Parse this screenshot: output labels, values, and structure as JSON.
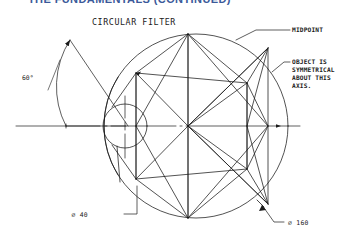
{
  "page": {
    "background_color": "#ffffff",
    "line_color": "#1a1a1a",
    "header_color": "#3b5a9a"
  },
  "header": {
    "clipped_text": "THE FUNDAMENTALS (CONTINUED)",
    "note": "top heading row is cropped off at the top edge"
  },
  "drawing": {
    "title": "CIRCULAR FILTER",
    "annotations": [
      {
        "id": "midpoint",
        "text": "MIDPOINT"
      },
      {
        "id": "symmetry-note",
        "lines": [
          "OBJECT IS",
          "SYMMETRICAL",
          "ABOUT THIS",
          "AXIS."
        ]
      }
    ],
    "dimensions": [
      {
        "id": "angle",
        "text": "60°"
      },
      {
        "id": "small-bore",
        "text": "⌀ 40"
      },
      {
        "id": "outer-circle",
        "text": "⌀ 160"
      }
    ],
    "geometry": {
      "outer_circle": {
        "cx": 196,
        "cy": 126,
        "r": 92
      },
      "inner_circle": {
        "cx": 125,
        "cy": 126,
        "r": 22
      },
      "angle_arc_degrees": 60
    }
  }
}
